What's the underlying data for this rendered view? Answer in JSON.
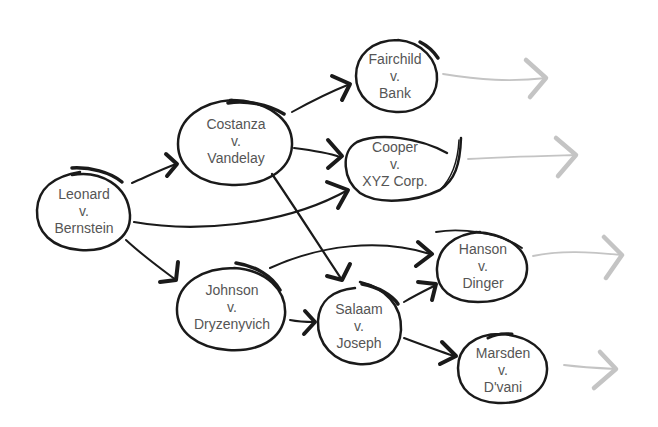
{
  "diagram": {
    "type": "case-citation-network",
    "nodes": [
      {
        "id": "leonard",
        "line1": "Leonard",
        "line2": "v.",
        "line3": "Bernstein"
      },
      {
        "id": "costanza",
        "line1": "Costanza",
        "line2": "v.",
        "line3": "Vandelay"
      },
      {
        "id": "fairchild",
        "line1": "Fairchild",
        "line2": "v.",
        "line3": "Bank"
      },
      {
        "id": "cooper",
        "line1": "Cooper",
        "line2": "v.",
        "line3": "XYZ Corp."
      },
      {
        "id": "johnson",
        "line1": "Johnson",
        "line2": "v.",
        "line3": "Dryzenyvich"
      },
      {
        "id": "salaam",
        "line1": "Salaam",
        "line2": "v.",
        "line3": "Joseph"
      },
      {
        "id": "hanson",
        "line1": "Hanson",
        "line2": "v.",
        "line3": "Dinger"
      },
      {
        "id": "marsden",
        "line1": "Marsden",
        "line2": "v.",
        "line3": "D'vani"
      }
    ],
    "edges": [
      {
        "from": "leonard",
        "to": "costanza"
      },
      {
        "from": "leonard",
        "to": "cooper"
      },
      {
        "from": "leonard",
        "to": "johnson"
      },
      {
        "from": "costanza",
        "to": "fairchild"
      },
      {
        "from": "costanza",
        "to": "cooper"
      },
      {
        "from": "costanza",
        "to": "salaam"
      },
      {
        "from": "johnson",
        "to": "hanson"
      },
      {
        "from": "johnson",
        "to": "salaam"
      },
      {
        "from": "salaam",
        "to": "hanson"
      },
      {
        "from": "salaam",
        "to": "marsden"
      }
    ],
    "continuation_arrows": [
      "fairchild",
      "cooper",
      "hanson",
      "marsden"
    ],
    "colors": {
      "stroke": "#1a1a1a",
      "text": "#555555",
      "continuation": "#c4c4c4",
      "background": "#ffffff"
    }
  }
}
